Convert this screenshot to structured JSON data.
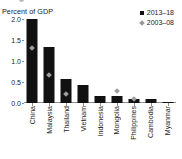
{
  "chart_data": {
    "type": "bar",
    "title": "Percent of GDP",
    "xlabel": "",
    "ylabel": "Percent of GDP",
    "ylim": [
      0.0,
      2.0
    ],
    "ytick_labels": [
      "0.0",
      "0.5",
      "1.0",
      "1.5",
      "2.0"
    ],
    "ytick_values": [
      0.0,
      0.5,
      1.0,
      1.5,
      2.0
    ],
    "grid": false,
    "legend_position": "top-right",
    "categories": [
      "China",
      "Malaysia",
      "Thailand",
      "Vietnam",
      "Indonesia",
      "Mongolia",
      "Philippines",
      "Cambodia",
      "Myanmar"
    ],
    "series": [
      {
        "name": "2013–18",
        "marker": "square",
        "color": "#111111",
        "render": "bar",
        "values": [
          2.0,
          1.33,
          0.57,
          0.43,
          0.17,
          0.17,
          0.1,
          0.09,
          0.02
        ]
      },
      {
        "name": "2003–08",
        "marker": "diamond",
        "color": "#9e9e9e",
        "render": "point",
        "values": [
          1.3,
          0.67,
          0.22,
          null,
          null,
          0.28,
          0.1,
          null,
          null
        ]
      }
    ]
  },
  "legend": {
    "items": [
      {
        "label": "2013–18",
        "marker": "square-marker-icon"
      },
      {
        "label": "2003–08",
        "marker": "diamond-marker-icon"
      }
    ]
  },
  "axis": {
    "title": "Percent of GDP"
  }
}
